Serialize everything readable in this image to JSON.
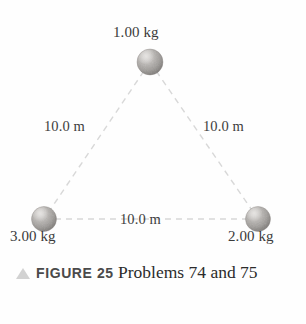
{
  "figure": {
    "masses": [
      {
        "id": "top",
        "label": "1.00 kg",
        "x": 150,
        "y": 62,
        "r": 13
      },
      {
        "id": "left",
        "label": "3.00 kg",
        "x": 44,
        "y": 219,
        "r": 12.5
      },
      {
        "id": "right",
        "label": "2.00 kg",
        "x": 258,
        "y": 219,
        "r": 12.5
      }
    ],
    "sides": [
      {
        "id": "left",
        "label": "10.0 m"
      },
      {
        "id": "right",
        "label": "10.0 m"
      },
      {
        "id": "bottom",
        "label": "10.0 m"
      }
    ],
    "caption": {
      "marker": "triangle-up-icon",
      "figure_label": "FIGURE 25",
      "text": "Problems 74 and 75"
    },
    "colors": {
      "dashed_line": "#d8d8d8",
      "sphere_light": "#cfcdcb",
      "sphere_mid": "#a8a5a2",
      "sphere_dark": "#7d7a77",
      "label_text": "#3a3a3a",
      "caption_marker": "#d2d2d2",
      "caption_label": "#4a4a4a",
      "caption_text": "#2b2b2b"
    }
  }
}
